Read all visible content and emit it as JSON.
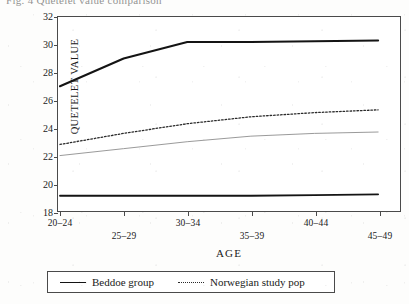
{
  "caption": "Fig. 4  Quetelet value comparison",
  "legend": {
    "entries": [
      {
        "label": "Beddoe group",
        "style": "solid"
      },
      {
        "label": "Norwegian study pop",
        "style": "dotted"
      }
    ]
  },
  "chart_data": {
    "type": "line",
    "title": "Fig. 4  Quetelet value comparison",
    "xlabel": "AGE",
    "ylabel": "QUETELET VALUE",
    "categories": [
      "20–24",
      "25–29",
      "30–34",
      "35–39",
      "40–44",
      "45–49"
    ],
    "ylim": [
      18,
      32
    ],
    "yticks": [
      18,
      20,
      22,
      24,
      26,
      28,
      30,
      32
    ],
    "grid": false,
    "legend_position": "below-plot",
    "series": [
      {
        "name": "Beddoe group",
        "style": "solid",
        "color": "#141414",
        "width": 2.1,
        "in_legend": true,
        "values": [
          27.0,
          29.0,
          30.2,
          30.2,
          30.25,
          30.3
        ]
      },
      {
        "name": "Norwegian study pop",
        "style": "dotted",
        "color": "#2a2a2a",
        "width": 1.3,
        "in_legend": true,
        "values": [
          22.8,
          23.6,
          24.3,
          24.8,
          25.1,
          25.3
        ]
      },
      {
        "name": "unlabelled thin line",
        "style": "solid",
        "color": "#8d8d8d",
        "width": 0.9,
        "in_legend": false,
        "values": [
          22.0,
          22.5,
          23.0,
          23.4,
          23.6,
          23.7
        ]
      },
      {
        "name": "unlabelled flat line",
        "style": "solid",
        "color": "#141414",
        "width": 1.8,
        "in_legend": false,
        "values": [
          19.1,
          19.1,
          19.1,
          19.1,
          19.15,
          19.2
        ]
      }
    ]
  }
}
